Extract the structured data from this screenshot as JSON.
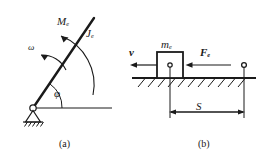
{
  "figure": {
    "background_color": "#ffffff",
    "line_color": "#1a1a1a",
    "width": 270,
    "height": 158
  },
  "panel_a": {
    "caption": "(a)",
    "description": "Pin-supported rigid rod rotating about a fixed pivot",
    "labels": {
      "moment": "M",
      "moment_subscript": "e",
      "inertia": "J",
      "inertia_subscript": "e",
      "angular_velocity": "ω",
      "angle": "φ"
    },
    "parts": {
      "pivot": "pin-support",
      "rod": "inclined-rod",
      "ground": "horizontal-reference-line",
      "hatching": "fixed-support-hatching",
      "moment_arc": "curved-moment-arrow",
      "omega_arc": "curved-angular-velocity-arrow",
      "angle_arc": "angle-arc"
    }
  },
  "panel_b": {
    "caption": "(b)",
    "description": "Block of mass m sliding along a horizontal surface under force F",
    "labels": {
      "velocity": "v",
      "mass": "m",
      "mass_subscript": "e",
      "force": "F",
      "force_subscript": "e",
      "displacement": "S"
    },
    "parts": {
      "block": "sliding-block",
      "block_center": "center-of-mass-dot",
      "ground": "ground-line",
      "hatching": "ground-hatching",
      "velocity_arrow": "velocity-arrow-left",
      "force_arrow": "force-arrow-left",
      "end_marker": "end-position-circle",
      "dimension_line": "displacement-dimension-line"
    }
  }
}
